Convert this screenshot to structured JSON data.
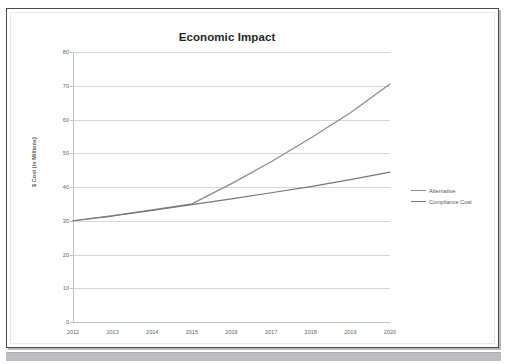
{
  "scan": {
    "top_fragment_text": "                                                                                                                              ",
    "page_border_color": "#4a4a4a",
    "bottom_bar_color": "#bdbdc1"
  },
  "chart_data": {
    "type": "line",
    "title": "Economic Impact",
    "xlabel": "",
    "ylabel": "$ Cost (in Millions)",
    "x": [
      2012,
      2013,
      2014,
      2015,
      2016,
      2017,
      2018,
      2019,
      2020
    ],
    "categories": [
      "2012",
      "2013",
      "2014",
      "2015",
      "2016",
      "2017",
      "2018",
      "2019",
      "2020"
    ],
    "series": [
      {
        "name": "Alternative",
        "color": "#8a8a8e",
        "values": [
          30.0,
          31.5,
          33.2,
          35.0,
          41.0,
          47.5,
          54.5,
          62.0,
          70.5
        ]
      },
      {
        "name": "Compliance Cost",
        "color": "#77777b",
        "values": [
          30.0,
          31.4,
          33.1,
          34.8,
          36.5,
          38.3,
          40.1,
          42.2,
          44.4
        ]
      }
    ],
    "ylim": [
      0,
      80
    ],
    "ytick_values": [
      0,
      10,
      20,
      30,
      40,
      50,
      60,
      70,
      80
    ],
    "ytick_labels": [
      "0",
      "10",
      "20",
      "30",
      "40",
      "50",
      "60",
      "70",
      "80"
    ],
    "xlim": [
      2012,
      2020
    ],
    "grid": "horizontal",
    "legend_position": "right"
  }
}
